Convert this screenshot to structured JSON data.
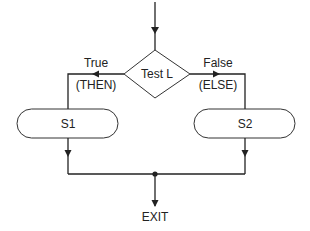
{
  "diagram": {
    "type": "if-then-else flowchart",
    "decision": {
      "label": "Test L"
    },
    "branches": {
      "true": {
        "label": "True",
        "sublabel": "(THEN)",
        "statement": "S1"
      },
      "false": {
        "label": "False",
        "sublabel": "(ELSE)",
        "statement": "S2"
      }
    },
    "exit": {
      "label": "EXIT"
    },
    "colors": {
      "line": "#222222",
      "shape_border": "#333333",
      "background": "#ffffff"
    }
  }
}
